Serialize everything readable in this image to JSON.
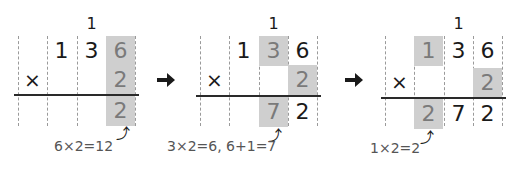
{
  "panels": [
    {
      "carry": "1",
      "top": [
        "",
        "1",
        "3",
        "6"
      ],
      "operator": "×",
      "multiplier": "2",
      "result": [
        "",
        "",
        "",
        "2"
      ],
      "note": "6×2=12"
    },
    {
      "carry": "1",
      "top": [
        "",
        "1",
        "3",
        "6"
      ],
      "operator": "×",
      "multiplier": "2",
      "result": [
        "",
        "",
        "7",
        "2"
      ],
      "note": "3×2=6, 6+1=7"
    },
    {
      "carry": "1",
      "top": [
        "",
        "1",
        "3",
        "6"
      ],
      "operator": "×",
      "multiplier": "2",
      "result": [
        "",
        "2",
        "7",
        "2"
      ],
      "note": "1×2=2"
    }
  ],
  "arrows": [
    "right-arrow",
    "right-arrow"
  ],
  "colors": {
    "shade": "#cfcfcf",
    "line": "#2a2a2a"
  }
}
